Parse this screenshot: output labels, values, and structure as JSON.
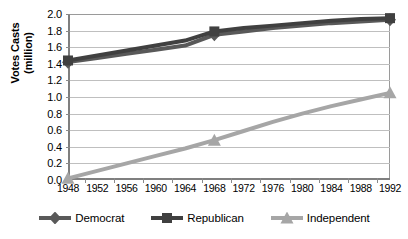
{
  "chart_data": {
    "type": "line",
    "title": "",
    "xlabel": "",
    "ylabel": "Votes Casts (million)",
    "ylabel_lines": [
      "Votes Casts",
      "(million)"
    ],
    "categories": [
      "1948",
      "1952",
      "1956",
      "1960",
      "1964",
      "1968",
      "1972",
      "1976",
      "1980",
      "1984",
      "1988",
      "1992"
    ],
    "x": [
      1948,
      1952,
      1956,
      1960,
      1964,
      1968,
      1972,
      1976,
      1980,
      1984,
      1988,
      1992
    ],
    "ylim": [
      0.0,
      2.0
    ],
    "ytick_labels": [
      "0.0",
      "0.2",
      "0.4",
      "0.6",
      "0.8",
      "1.0",
      "1.2",
      "1.4",
      "1.6",
      "1.8",
      "2.0"
    ],
    "ytick_values": [
      0.0,
      0.2,
      0.4,
      0.6,
      0.8,
      1.0,
      1.2,
      1.4,
      1.6,
      1.8,
      2.0
    ],
    "grid": true,
    "legend_position": "bottom",
    "marker_years": [
      1948,
      1968,
      1992
    ],
    "series": [
      {
        "name": "Democrat",
        "marker": "diamond",
        "color": "#595959",
        "values": [
          1.42,
          1.47,
          1.52,
          1.57,
          1.62,
          1.75,
          1.79,
          1.83,
          1.86,
          1.89,
          1.91,
          1.93
        ],
        "labeled_points": [
          {
            "x": 1948,
            "y": 1.42
          },
          {
            "x": 1968,
            "y": 1.75
          },
          {
            "x": 1992,
            "y": 1.93
          }
        ]
      },
      {
        "name": "Republican",
        "marker": "square",
        "color": "#404040",
        "values": [
          1.44,
          1.5,
          1.56,
          1.62,
          1.68,
          1.79,
          1.83,
          1.86,
          1.89,
          1.92,
          1.94,
          1.95
        ],
        "labeled_points": [
          {
            "x": 1948,
            "y": 1.44
          },
          {
            "x": 1968,
            "y": 1.79
          },
          {
            "x": 1992,
            "y": 1.95
          }
        ]
      },
      {
        "name": "Independent",
        "marker": "triangle",
        "color": "#a6a6a6",
        "values": [
          0.02,
          0.11,
          0.2,
          0.29,
          0.38,
          0.48,
          0.59,
          0.7,
          0.8,
          0.89,
          0.97,
          1.05
        ],
        "labeled_points": [
          {
            "x": 1948,
            "y": 0.02
          },
          {
            "x": 1968,
            "y": 0.48
          },
          {
            "x": 1992,
            "y": 1.05
          }
        ]
      }
    ]
  },
  "legend": {
    "items": [
      {
        "label": "Democrat",
        "color": "#595959",
        "marker": "diamond"
      },
      {
        "label": "Republican",
        "color": "#404040",
        "marker": "square"
      },
      {
        "label": "Independent",
        "color": "#a6a6a6",
        "marker": "triangle"
      }
    ]
  },
  "colors": {
    "democrat": "#595959",
    "republican": "#404040",
    "independent": "#a6a6a6",
    "grid": "#bfbfbf",
    "axis": "#7f7f7f",
    "background": "#ffffff"
  }
}
